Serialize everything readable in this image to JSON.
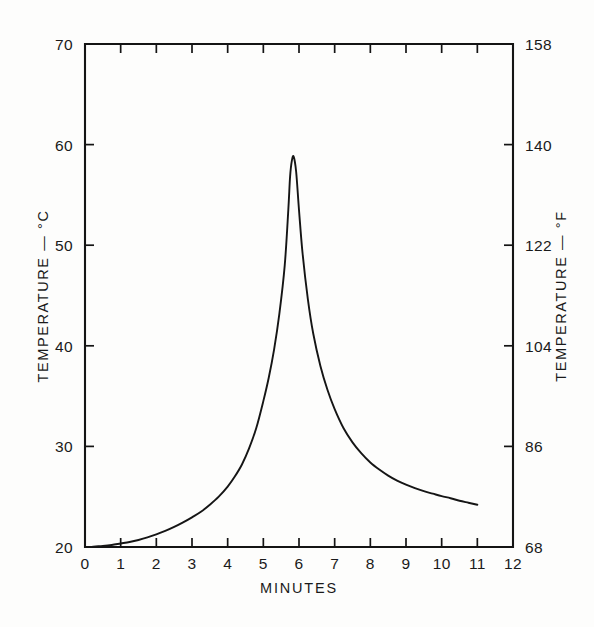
{
  "figure": {
    "background_color": "#fdfdfc",
    "line_color": "#151515",
    "text_color": "#1a1a1a"
  },
  "chart_data": {
    "type": "line",
    "title": "",
    "subtitle": "",
    "xlabel": "MINUTES",
    "ylabel": "TEMPERATURE — °C",
    "y2label": "TEMPERATURE — °F",
    "xlim": [
      0,
      12
    ],
    "ylim": [
      20,
      70
    ],
    "y2lim": [
      68,
      158
    ],
    "grid": false,
    "legend": "none",
    "xticks": [
      0,
      1,
      2,
      3,
      4,
      5,
      6,
      7,
      8,
      9,
      10,
      11,
      12
    ],
    "xticklabels": [
      "0",
      "1",
      "2",
      "3",
      "4",
      "5",
      "6",
      "7",
      "8",
      "9",
      "10",
      "11",
      "12"
    ],
    "yticks": [
      20,
      30,
      40,
      50,
      60,
      70
    ],
    "yticklabels": [
      "20",
      "30",
      "40",
      "50",
      "60",
      "70"
    ],
    "y2ticks": [
      68,
      86,
      104,
      122,
      140,
      158
    ],
    "y2ticklabels": [
      "68",
      "86",
      "104",
      "122",
      "140",
      "158"
    ],
    "annotations": [],
    "series": [
      {
        "name": "temperature",
        "x": [
          0.0,
          0.15,
          0.3,
          0.5,
          0.75,
          1.0,
          1.25,
          1.5,
          1.75,
          2.0,
          2.25,
          2.5,
          2.75,
          3.0,
          3.25,
          3.5,
          3.75,
          4.0,
          4.2,
          4.4,
          4.6,
          4.8,
          5.0,
          5.15,
          5.3,
          5.45,
          5.6,
          5.7,
          5.75,
          5.8,
          5.85,
          5.92,
          6.0,
          6.1,
          6.25,
          6.4,
          6.6,
          6.8,
          7.0,
          7.25,
          7.5,
          7.75,
          8.0,
          8.25,
          8.5,
          8.75,
          9.0,
          9.25,
          9.5,
          9.75,
          10.0,
          10.25,
          10.5,
          10.75,
          11.0
        ],
        "y": [
          20.0,
          20.0,
          20.05,
          20.1,
          20.2,
          20.35,
          20.5,
          20.7,
          20.95,
          21.25,
          21.6,
          22.0,
          22.45,
          22.95,
          23.5,
          24.2,
          25.0,
          26.0,
          27.0,
          28.2,
          29.8,
          31.8,
          34.5,
          36.8,
          39.6,
          43.2,
          48.0,
          53.5,
          56.8,
          58.4,
          58.8,
          57.3,
          53.5,
          49.2,
          44.6,
          41.2,
          38.0,
          35.6,
          33.7,
          31.8,
          30.4,
          29.3,
          28.4,
          27.7,
          27.1,
          26.6,
          26.2,
          25.85,
          25.55,
          25.3,
          25.05,
          24.85,
          24.6,
          24.4,
          24.2
        ],
        "peak": {
          "x": 5.85,
          "y": 58.8
        },
        "start": {
          "x": 0,
          "y": 20.0
        },
        "end": {
          "x": 11,
          "y": 24.2
        }
      }
    ]
  }
}
